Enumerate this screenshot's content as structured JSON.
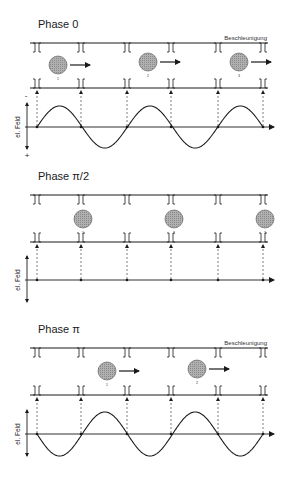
{
  "panels": [
    {
      "id": "phase-0",
      "title": "Phase 0",
      "accel_label": "Beschleunigung",
      "y_label": "el. Feld",
      "sign_top": "-",
      "sign_bottom": "+",
      "show_accel_label": true,
      "show_signs": true,
      "top_rail_y": 43,
      "bottom_rail_y": 88,
      "axis_y": 127,
      "amplitude": 21,
      "wave": "sine-positive-first",
      "balls": [
        {
          "label": "1",
          "x": 58,
          "y": 65,
          "arrow": true
        },
        {
          "label": "2",
          "x": 148,
          "y": 62,
          "arrow": true
        },
        {
          "label": "3",
          "x": 239,
          "y": 62,
          "arrow": true
        }
      ]
    },
    {
      "id": "phase-pi-2",
      "title": "Phase π/2",
      "accel_label": "",
      "y_label": "el. Feld",
      "show_accel_label": false,
      "show_signs": false,
      "top_rail_y": 195,
      "bottom_rail_y": 242,
      "axis_y": 280,
      "amplitude": 0,
      "wave": "flat",
      "balls": [
        {
          "label": "1",
          "x": 83,
          "y": 219,
          "arrow": false
        },
        {
          "label": "2",
          "x": 174,
          "y": 219,
          "arrow": false
        },
        {
          "label": "3",
          "x": 265,
          "y": 219,
          "arrow": false
        }
      ]
    },
    {
      "id": "phase-pi",
      "title": "Phase π",
      "accel_label": "Beschleunigung",
      "y_label": "el. Feld",
      "show_accel_label": true,
      "show_signs": false,
      "top_rail_y": 348,
      "bottom_rail_y": 395,
      "axis_y": 434,
      "amplitude": 22,
      "wave": "sine-negative-first",
      "balls": [
        {
          "label": "1",
          "x": 107,
          "y": 371,
          "arrow": true
        },
        {
          "label": "2",
          "x": 197,
          "y": 369,
          "arrow": true
        }
      ]
    }
  ],
  "gap_positions_x": [
    37,
    81,
    127,
    171,
    218,
    263
  ],
  "colors": {
    "line": "#1a1a1a",
    "ball_fill": "#a8a8a8",
    "dashed": "#444444"
  }
}
